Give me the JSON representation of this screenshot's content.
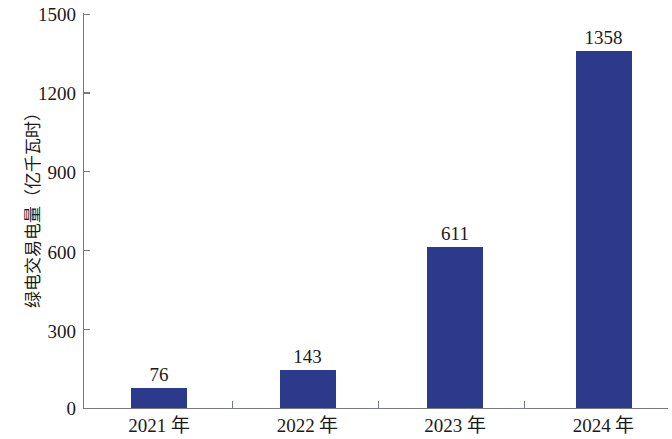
{
  "chart_data": {
    "type": "bar",
    "title": "",
    "subtitle": "",
    "xlabel": "",
    "ylabel": "绿电交易电量（亿千瓦时）",
    "categories": [
      "2021 年",
      "2022 年",
      "2023 年",
      "2024 年"
    ],
    "values": [
      76,
      143,
      611,
      1358
    ],
    "value_labels": [
      "76",
      "143",
      "611",
      "1358"
    ],
    "series": [
      {
        "name": "绿电交易电量",
        "values": [
          76,
          143,
          611,
          1358
        ],
        "color": "#2b3a8b"
      }
    ],
    "ylim": [
      0,
      1500
    ],
    "y_ticks": [
      0,
      300,
      600,
      900,
      1200,
      1500
    ],
    "y_tick_labels": [
      "0",
      "300",
      "600",
      "900",
      "1200",
      "1500"
    ],
    "grid": false,
    "legend": null,
    "legend_position": "none",
    "axis_color": "#777a7e",
    "text_color": "#1a1a1a",
    "background": "#ffffff"
  },
  "axis": {
    "y_title": "绿电交易电量（亿千瓦时）"
  }
}
